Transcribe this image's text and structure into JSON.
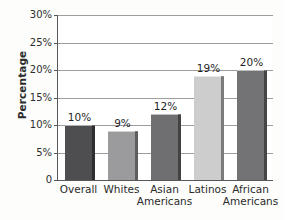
{
  "chart_data": {
    "type": "bar",
    "title": "",
    "xlabel": "",
    "ylabel": "Percentage",
    "ylim": [
      0,
      30
    ],
    "grid": true,
    "legend": "none",
    "categories": [
      "Overall",
      "Whites",
      "Asian Americans",
      "Latinos",
      "African Americans"
    ],
    "category_lines": [
      [
        "Overall"
      ],
      [
        "Whites"
      ],
      [
        "Asian",
        "Americans"
      ],
      [
        "Latinos"
      ],
      [
        "African",
        "Americans"
      ]
    ],
    "values": [
      10,
      9,
      12,
      19,
      20
    ],
    "value_labels": [
      "10%",
      "9%",
      "12%",
      "19%",
      "20%"
    ],
    "bar_colors": [
      "#4e4e50",
      "#9b9b9d",
      "#6f6f71",
      "#cdcdcd",
      "#737375"
    ],
    "ytick_labels": [
      "30%",
      "25%",
      "20%",
      "15%",
      "10%",
      "5%",
      "0"
    ],
    "ytick_values": [
      30,
      25,
      20,
      15,
      10,
      5,
      0
    ]
  }
}
